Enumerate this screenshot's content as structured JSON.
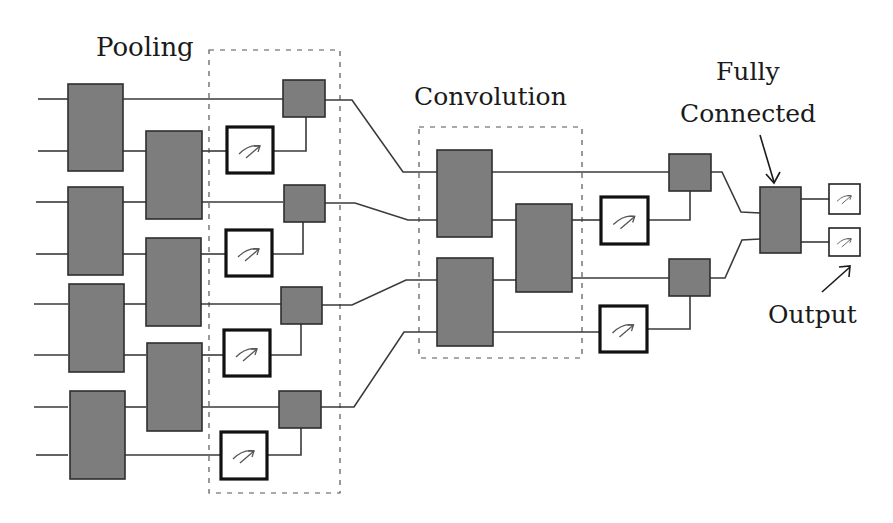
{
  "diagram": {
    "type": "quantum convolutional neural network circuit",
    "labels": {
      "pooling": "Pooling",
      "convolution": "Convolution",
      "fully_connected_line1": "Fully",
      "fully_connected_line2": "Connected",
      "output": "Output"
    },
    "colors": {
      "block_fill": "#7d7d7d",
      "block_stroke": "#2e2e2e",
      "wire": "#3a3a3a",
      "meter_stroke": "#111111",
      "background": "#ffffff"
    },
    "sections": [
      {
        "name": "input-layer",
        "qubits": 8,
        "two_qubit_blocks": 7
      },
      {
        "name": "pooling",
        "measurements": 4,
        "controlled_blocks": 4
      },
      {
        "name": "convolution",
        "two_qubit_blocks": 3
      },
      {
        "name": "second-pooling",
        "measurements": 2,
        "controlled_blocks": 2
      },
      {
        "name": "fully-connected",
        "blocks": 1
      },
      {
        "name": "output",
        "measurements": 2
      }
    ],
    "icons": {
      "gate": "gate-block-icon",
      "measurement": "measurement-meter-icon",
      "arrow": "pointer-arrow-icon"
    }
  }
}
